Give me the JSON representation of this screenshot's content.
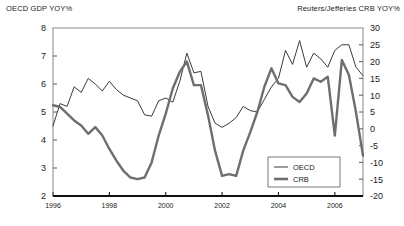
{
  "axis_titles": {
    "left": "OECD GDP YOY%",
    "right": "Reuters/Jefferies CRB YOY%"
  },
  "legend": {
    "items": [
      {
        "label": "OECD",
        "style": "thin-line",
        "color": "#3a3a3a"
      },
      {
        "label": "CRB",
        "style": "thick-line",
        "color": "#6e6e6e"
      }
    ]
  },
  "chart_data": {
    "type": "line",
    "title": "",
    "subtitle": "",
    "xlabel": "",
    "ylabel": "OECD GDP YOY%",
    "y2label": "Reuters/Jefferies CRB YOY%",
    "grid": false,
    "legend_position": "inside-bottom-right",
    "xlim": [
      1996.0,
      2007.0
    ],
    "ylim": [
      2,
      8
    ],
    "y2lim": [
      -20,
      30
    ],
    "xticks": [
      1996,
      1998,
      2000,
      2002,
      2004,
      2006
    ],
    "xticklabels": [
      "1996",
      "1998",
      "2000",
      "2002",
      "2004",
      "2006"
    ],
    "yticks": [
      2,
      3,
      4,
      5,
      6,
      7,
      8
    ],
    "yticklabels": [
      "2",
      "3",
      "4",
      "5",
      "6",
      "7",
      "8"
    ],
    "y2ticks": [
      -20,
      -15,
      -10,
      -5,
      0,
      5,
      10,
      15,
      20,
      25,
      30
    ],
    "y2ticklabels": [
      "-20",
      "-15",
      "-10",
      "-5",
      "0",
      "5",
      "10",
      "15",
      "20",
      "25",
      "30"
    ],
    "series": [
      {
        "name": "OECD",
        "axis": "left",
        "color": "#3a3a3a",
        "width": 1.0,
        "x": [
          1996.0,
          1996.25,
          1996.5,
          1996.75,
          1997.0,
          1997.25,
          1997.5,
          1997.75,
          1998.0,
          1998.25,
          1998.5,
          1998.75,
          1999.0,
          1999.25,
          1999.5,
          1999.75,
          2000.0,
          2000.25,
          2000.5,
          2000.75,
          2001.0,
          2001.25,
          2001.5,
          2001.75,
          2002.0,
          2002.25,
          2002.5,
          2002.75,
          2003.0,
          2003.25,
          2003.5,
          2003.75,
          2004.0,
          2004.25,
          2004.5,
          2004.75,
          2005.0,
          2005.25,
          2005.5,
          2005.75,
          2006.0,
          2006.25,
          2006.5,
          2006.75,
          2007.0
        ],
        "y": [
          4.5,
          5.3,
          5.2,
          5.9,
          5.7,
          6.2,
          6.0,
          5.75,
          6.1,
          5.8,
          5.6,
          5.5,
          5.4,
          4.9,
          4.85,
          5.4,
          5.5,
          5.35,
          6.1,
          7.1,
          6.4,
          6.45,
          5.2,
          4.6,
          4.45,
          4.6,
          4.8,
          5.2,
          5.05,
          5.0,
          5.45,
          5.9,
          6.2,
          7.2,
          6.7,
          7.55,
          6.6,
          7.1,
          6.9,
          6.6,
          7.2,
          7.4,
          7.4,
          6.6,
          6.3
        ]
      },
      {
        "name": "CRB",
        "axis": "right",
        "color": "#6e6e6e",
        "width": 2.4,
        "x": [
          1996.0,
          1996.25,
          1996.5,
          1996.75,
          1997.0,
          1997.25,
          1997.5,
          1997.75,
          1998.0,
          1998.25,
          1998.5,
          1998.75,
          1999.0,
          1999.25,
          1999.5,
          1999.75,
          2000.0,
          2000.25,
          2000.5,
          2000.75,
          2001.0,
          2001.25,
          2001.5,
          2001.75,
          2002.0,
          2002.25,
          2002.5,
          2002.75,
          2003.0,
          2003.25,
          2003.5,
          2003.75,
          2004.0,
          2004.25,
          2004.5,
          2004.75,
          2005.0,
          2005.25,
          2005.5,
          2005.75,
          2006.0,
          2006.25,
          2006.5,
          2006.75,
          2007.0
        ],
        "y": [
          7.0,
          6.5,
          4.5,
          2.5,
          1.0,
          -1.5,
          0.5,
          -2.0,
          -6.0,
          -9.5,
          -12.5,
          -14.5,
          -15.0,
          -14.5,
          -10.0,
          -2.0,
          4.5,
          12.0,
          17.0,
          20.0,
          13.0,
          13.0,
          4.0,
          -6.5,
          -14.0,
          -13.5,
          -14.0,
          -6.5,
          -1.0,
          5.0,
          12.5,
          18.0,
          13.5,
          13.0,
          9.5,
          8.0,
          10.5,
          15.0,
          14.0,
          15.5,
          -2.0,
          20.5,
          16.0,
          5.0,
          -8.0
        ]
      }
    ]
  }
}
